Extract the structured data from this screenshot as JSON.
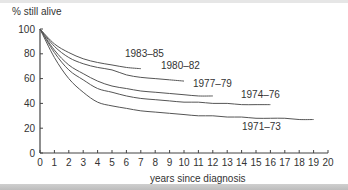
{
  "chart_data": {
    "type": "line",
    "title": "",
    "ylabel": "% still alive",
    "xlabel": "years since diagnosis",
    "xlim": [
      0,
      20
    ],
    "ylim": [
      0,
      100
    ],
    "xticks": [
      0,
      1,
      2,
      3,
      4,
      5,
      6,
      7,
      8,
      9,
      10,
      11,
      12,
      13,
      14,
      15,
      16,
      17,
      18,
      19,
      20
    ],
    "yticks": [
      0,
      20,
      40,
      60,
      80,
      100
    ],
    "grid": false,
    "legend": "inline labels at curve ends",
    "series": [
      {
        "name": "1983–85",
        "x": [
          0,
          1,
          2,
          3,
          4,
          5,
          6,
          7
        ],
        "values": [
          100,
          88,
          81,
          76,
          73,
          71,
          69,
          68
        ]
      },
      {
        "name": "1980–82",
        "x": [
          0,
          1,
          2,
          3,
          4,
          5,
          6,
          7,
          8,
          9,
          10
        ],
        "values": [
          100,
          86,
          77,
          72,
          69,
          67,
          63,
          61,
          60,
          59,
          58
        ]
      },
      {
        "name": "1977–79",
        "x": [
          0,
          1,
          2,
          3,
          4,
          5,
          6,
          7,
          8,
          9,
          10,
          11,
          12
        ],
        "values": [
          100,
          83,
          71,
          64,
          58,
          54,
          52,
          50,
          49,
          48,
          47,
          46,
          46
        ]
      },
      {
        "name": "1974–76",
        "x": [
          0,
          1,
          2,
          3,
          4,
          5,
          6,
          7,
          8,
          9,
          10,
          11,
          12,
          13,
          14,
          15,
          16
        ],
        "values": [
          100,
          81,
          67,
          59,
          52,
          49,
          46,
          44,
          43,
          42,
          41,
          41,
          40,
          40,
          39,
          39,
          39
        ]
      },
      {
        "name": "1971–73",
        "x": [
          0,
          1,
          2,
          3,
          4,
          5,
          6,
          7,
          8,
          9,
          10,
          11,
          12,
          13,
          14,
          15,
          16,
          17,
          18,
          19
        ],
        "values": [
          100,
          77,
          60,
          49,
          41,
          38,
          36,
          34,
          33,
          32,
          31,
          30,
          30,
          29,
          29,
          28,
          28,
          28,
          27,
          27
        ]
      }
    ]
  },
  "labels": {
    "ylabel": "% still alive",
    "xlabel": "years since diagnosis",
    "s0": "1983–85",
    "s1": "1980–82",
    "s2": "1977–79",
    "s3": "1974–76",
    "s4": "1971–73"
  },
  "colors": {
    "line": "#555555",
    "axis": "#444444",
    "text": "#333333"
  }
}
